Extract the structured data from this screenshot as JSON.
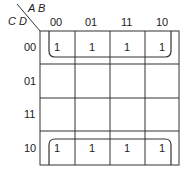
{
  "kmap": {
    "row_var_label": "C D",
    "col_var_label": "A B",
    "col_headers": [
      "00",
      "01",
      "11",
      "10"
    ],
    "row_headers": [
      "00",
      "01",
      "11",
      "10"
    ],
    "cells": [
      [
        "1",
        "1",
        "1",
        "1"
      ],
      [
        "",
        "",
        "",
        ""
      ],
      [
        "",
        "",
        "",
        ""
      ],
      [
        "1",
        "1",
        "1",
        "1"
      ]
    ],
    "groupings": [
      {
        "name": "top-row-loop",
        "rows": [
          "00"
        ],
        "cols": [
          "00",
          "01",
          "11",
          "10"
        ],
        "wraps": "top"
      },
      {
        "name": "bottom-row-loop",
        "rows": [
          "10"
        ],
        "cols": [
          "00",
          "01",
          "11",
          "10"
        ],
        "wraps": "bottom"
      }
    ]
  }
}
